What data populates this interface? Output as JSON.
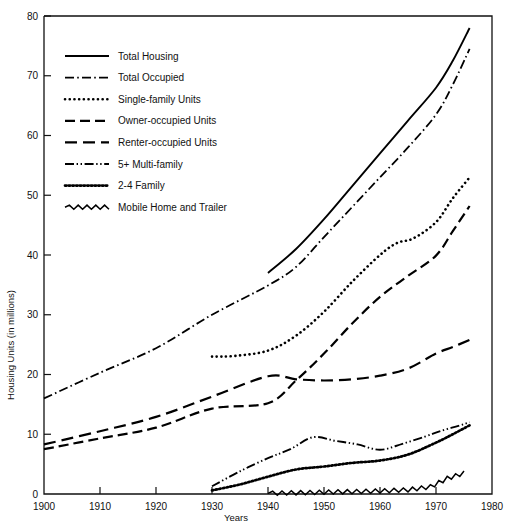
{
  "chart_data": {
    "type": "line",
    "title": "",
    "xlabel": "Years",
    "ylabel": "Housing Units (in millions)",
    "xlim": [
      1900,
      1980
    ],
    "ylim": [
      0,
      80
    ],
    "xticks": [
      1900,
      1910,
      1920,
      1930,
      1940,
      1950,
      1960,
      1970,
      1980
    ],
    "yticks": [
      0,
      10,
      20,
      30,
      40,
      50,
      60,
      70,
      80
    ],
    "grid": false,
    "legend_position": "upper-left-inside",
    "series": [
      {
        "name": "Total Housing",
        "style": "solid",
        "x": [
          1940,
          1945,
          1950,
          1955,
          1960,
          1965,
          1970,
          1973,
          1976
        ],
        "values": [
          37.0,
          41.0,
          46.0,
          51.5,
          57.0,
          62.5,
          68.0,
          72.5,
          78.0
        ]
      },
      {
        "name": "Total Occupied",
        "style": "dash-dot",
        "x": [
          1900,
          1910,
          1920,
          1930,
          1940,
          1945,
          1950,
          1955,
          1960,
          1965,
          1970,
          1973,
          1976
        ],
        "values": [
          16.0,
          20.3,
          24.4,
          30.0,
          34.9,
          38.0,
          43.0,
          48.0,
          53.0,
          58.0,
          63.5,
          68.5,
          74.5
        ]
      },
      {
        "name": "Single-family Units",
        "style": "dotted",
        "x": [
          1930,
          1934,
          1940,
          1945,
          1950,
          1955,
          1960,
          1963,
          1966,
          1970,
          1973,
          1976
        ],
        "values": [
          23.0,
          23.1,
          24.0,
          26.5,
          30.5,
          35.5,
          40.0,
          42.0,
          42.8,
          45.5,
          49.5,
          53.0
        ]
      },
      {
        "name": "Owner-occupied Units",
        "style": "dashed-long",
        "x": [
          1900,
          1910,
          1920,
          1930,
          1940,
          1945,
          1950,
          1955,
          1960,
          1965,
          1970,
          1973,
          1976
        ],
        "values": [
          7.5,
          9.3,
          11.1,
          14.3,
          15.2,
          19.0,
          23.5,
          28.5,
          33.0,
          36.5,
          39.9,
          44.0,
          48.2
        ]
      },
      {
        "name": "Renter-occupied Units",
        "style": "dashed-medium",
        "x": [
          1900,
          1910,
          1920,
          1930,
          1940,
          1945,
          1950,
          1955,
          1960,
          1965,
          1970,
          1973,
          1976
        ],
        "values": [
          8.3,
          10.5,
          12.9,
          16.3,
          19.7,
          19.2,
          19.0,
          19.2,
          19.8,
          21.0,
          23.5,
          24.6,
          25.8
        ]
      },
      {
        "name": "5+ Multi-family",
        "style": "dash-dot-dot",
        "x": [
          1930,
          1935,
          1940,
          1944,
          1948,
          1952,
          1956,
          1960,
          1964,
          1968,
          1971,
          1974,
          1976
        ],
        "values": [
          1.3,
          3.8,
          6.0,
          7.5,
          9.5,
          8.9,
          8.3,
          7.4,
          8.4,
          9.6,
          10.6,
          11.4,
          12.0
        ]
      },
      {
        "name": "2-4 Family",
        "style": "dotted-dense",
        "x": [
          1930,
          1935,
          1940,
          1945,
          1950,
          1955,
          1960,
          1965,
          1970,
          1973,
          1976
        ],
        "values": [
          0.6,
          1.6,
          2.9,
          4.1,
          4.6,
          5.2,
          5.6,
          6.6,
          8.6,
          10.0,
          11.5
        ]
      },
      {
        "name": "Mobile Home and Trailer",
        "style": "zigzag",
        "x": [
          1940,
          1945,
          1950,
          1955,
          1960,
          1965,
          1969,
          1972,
          1975
        ],
        "values": [
          0.1,
          0.2,
          0.3,
          0.4,
          0.5,
          0.7,
          1.2,
          2.6,
          3.5
        ]
      }
    ]
  },
  "legend": {
    "items": [
      {
        "label": "Total Housing",
        "style": "solid"
      },
      {
        "label": "Total Occupied",
        "style": "dash-dot"
      },
      {
        "label": "Single-family Units",
        "style": "dotted"
      },
      {
        "label": "Owner-occupied Units",
        "style": "dashed-long"
      },
      {
        "label": "Renter-occupied Units",
        "style": "dashed-medium"
      },
      {
        "label": "5+ Multi-family",
        "style": "dash-dot-dot"
      },
      {
        "label": "2-4 Family",
        "style": "dotted-dense"
      },
      {
        "label": "Mobile Home and Trailer",
        "style": "zigzag"
      }
    ]
  }
}
